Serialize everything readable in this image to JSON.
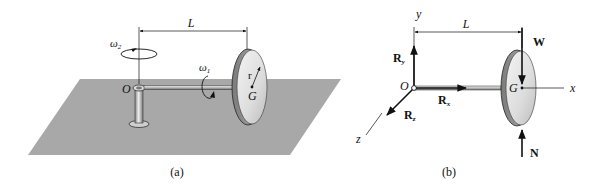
{
  "figure": {
    "panels": [
      {
        "id": "a",
        "caption": "(a)",
        "labels": {
          "length": "L",
          "omega2": "ω",
          "omega2_sub": "2",
          "omega1": "ω",
          "omega1_sub": "1",
          "radius": "r",
          "origin": "O",
          "center": "G"
        }
      },
      {
        "id": "b",
        "caption": "(b)",
        "labels": {
          "y_axis": "y",
          "x_axis": "x",
          "z_axis": "z",
          "length": "L",
          "origin": "O",
          "center": "G",
          "Ry": "R",
          "Ry_sub": "y",
          "Rx": "R",
          "Rx_sub": "x",
          "Rz": "R",
          "Rz_sub": "z",
          "weight": "W",
          "normal": "N"
        }
      }
    ],
    "colors": {
      "ground": "#a8a8a8",
      "ink": "#111111",
      "disk_face": "#e4e4e4",
      "disk_rim": "#9a9a9a",
      "shaft": "#c8c8c8"
    }
  }
}
